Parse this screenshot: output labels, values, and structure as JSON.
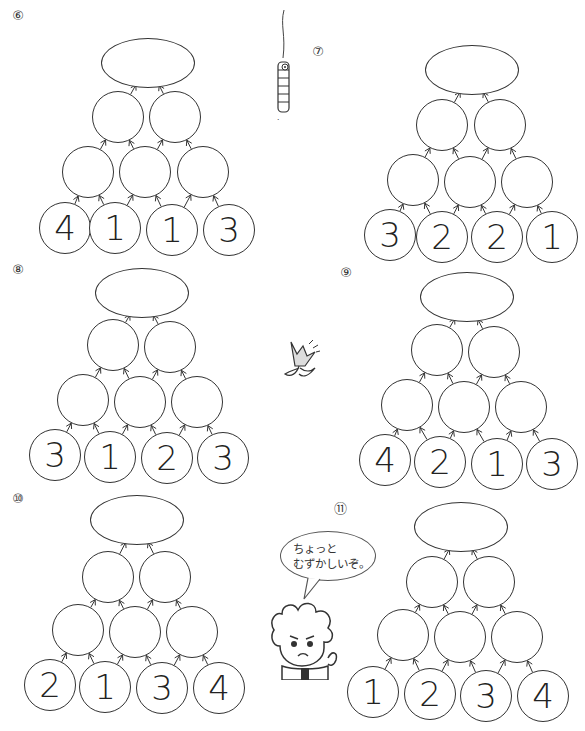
{
  "problems": [
    {
      "label": "⑥",
      "bottom": [
        "4",
        "1",
        "1",
        "3"
      ]
    },
    {
      "label": "⑦",
      "bottom": [
        "3",
        "2",
        "2",
        "1"
      ]
    },
    {
      "label": "⑧",
      "bottom": [
        "3",
        "1",
        "2",
        "3"
      ]
    },
    {
      "label": "⑨",
      "bottom": [
        "4",
        "2",
        "1",
        "3"
      ]
    },
    {
      "label": "⑩",
      "bottom": [
        "2",
        "1",
        "3",
        "4"
      ]
    },
    {
      "label": "⑪",
      "bottom": [
        "1",
        "2",
        "3",
        "4"
      ]
    }
  ],
  "speech_bubble": {
    "line1": "ちょっと",
    "line2": "むずかしいぞ。"
  },
  "decorations": {
    "top": "caterpillar-hanging",
    "middle": "tulip-flower",
    "bottom": "boy-character"
  }
}
